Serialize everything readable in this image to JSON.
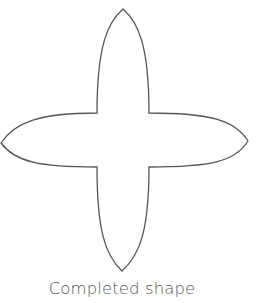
{
  "figure": {
    "shape_name": "four-petal cross",
    "stroke_color": "#555555",
    "fill_color": "#ffffff",
    "stroke_width": 1.3
  },
  "caption": {
    "text": "Completed shape"
  }
}
